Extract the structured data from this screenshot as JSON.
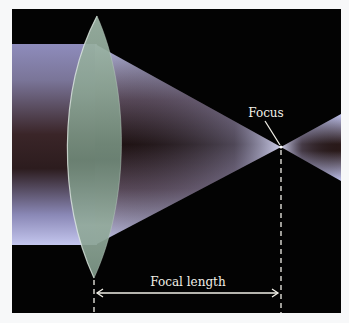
{
  "diagram": {
    "type": "converging-lens-ray-diagram",
    "labels": {
      "focus": "Focus",
      "focal_length": "Focal length"
    },
    "colors": {
      "background": "#030303",
      "page": "#f7f8f9",
      "beam_light": "#b9bde6",
      "beam_mid": "#7c7aa8",
      "beam_dark": "#2a1a1c",
      "lens": "#8fa898",
      "lens_edge": "#d6e4da",
      "annotation": "#f2f0e8"
    }
  }
}
